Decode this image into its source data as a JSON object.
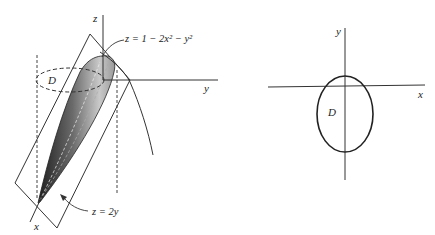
{
  "left_figure": {
    "axis_labels": {
      "z": "z",
      "y": "y",
      "x": "x"
    },
    "region_label": "D",
    "surface_label": "z = 1 − 2x² − y²",
    "plane_label": "z = 2y"
  },
  "right_figure": {
    "axis_labels": {
      "y": "y",
      "x": "x"
    },
    "region_label": "D"
  },
  "colors": {
    "line": "#333333",
    "shade_dark": "#2a2a2a",
    "shade_light": "#d8d8d8"
  }
}
